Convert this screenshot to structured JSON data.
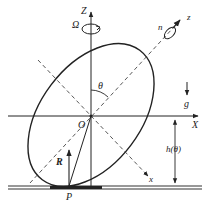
{
  "diagram": {
    "labels": {
      "Z": "Z",
      "Omega": "Ω",
      "n": "n",
      "z": "z",
      "theta": "θ",
      "g": "g",
      "O": "O",
      "X": "X",
      "h": "h(θ)",
      "R": "R",
      "x": "x",
      "P": "P"
    },
    "colors": {
      "ink": "#222222",
      "dashed": "#444444",
      "ground": "#333333"
    }
  }
}
